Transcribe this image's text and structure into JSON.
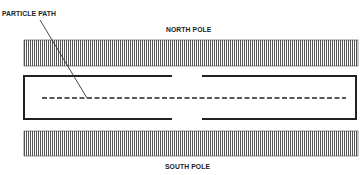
{
  "diagram": {
    "labels": {
      "particle_path": "PARTICLE PATH",
      "north_pole": "NORTH POLE",
      "south_pole": "SOUTH POLE"
    },
    "colors": {
      "ink": "#222222",
      "hatch": "#555555",
      "background": "#ffffff"
    },
    "elements": [
      {
        "id": "north-pole-bar",
        "type": "hatched-bar",
        "x": 24,
        "y": 40,
        "w": 334,
        "h": 26
      },
      {
        "id": "south-pole-bar",
        "type": "hatched-bar",
        "x": 24,
        "y": 131,
        "w": 334,
        "h": 25
      },
      {
        "id": "chamber",
        "type": "split-box",
        "left": 24,
        "top": 76,
        "right": 356,
        "bottom": 119,
        "gap": [
          172,
          202
        ]
      },
      {
        "id": "particle-path",
        "type": "dashed-line",
        "x1": 42,
        "x2": 346,
        "y": 98
      },
      {
        "id": "leader-line",
        "type": "line",
        "from": [
          40,
          20
        ],
        "to": [
          87,
          98
        ]
      }
    ]
  }
}
